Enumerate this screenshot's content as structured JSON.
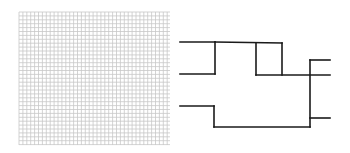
{
  "grid_panel": {
    "x": 19,
    "y": 12,
    "width": 151,
    "height": 133,
    "cell": 3.9,
    "line_color": "#c8c8c8",
    "major_every": 0,
    "major_color": "#bdbdbd"
  },
  "dendrogram": {
    "stroke": "#1a1a1a",
    "stroke_width": 1.6,
    "segments": [
      [
        180,
        42,
        215,
        42
      ],
      [
        180,
        74,
        215,
        74
      ],
      [
        215,
        42,
        215,
        74
      ],
      [
        215,
        42,
        282,
        43
      ],
      [
        256,
        43,
        256,
        75
      ],
      [
        282,
        43,
        282,
        75
      ],
      [
        256,
        75,
        330,
        75
      ],
      [
        310,
        60,
        310,
        127
      ],
      [
        310,
        60,
        330,
        60
      ],
      [
        310,
        118,
        330,
        118
      ],
      [
        180,
        106,
        214,
        106
      ],
      [
        214,
        106,
        214,
        127
      ],
      [
        214,
        127,
        310,
        127
      ]
    ]
  }
}
